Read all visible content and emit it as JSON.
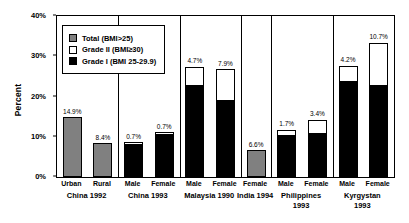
{
  "chart_data": {
    "type": "bar",
    "title": "",
    "subtitle": "",
    "xlabel": "",
    "ylabel": "Percent",
    "ylim": [
      0,
      40
    ],
    "ytick_labels": [
      "0%",
      "10%",
      "20%",
      "30%",
      "40%"
    ],
    "ytick_values": [
      0,
      10,
      20,
      30,
      40
    ],
    "grid": false,
    "stacked": true,
    "legend_position": "upper-left-inside",
    "legend": [
      {
        "key": "total",
        "label": "Total (BMI>25)",
        "color": "#808080"
      },
      {
        "key": "grade2",
        "label": "Grade II (BMI≥30)",
        "color": "#ffffff"
      },
      {
        "key": "grade1",
        "label": "Grade I (BMI 25-29.9)",
        "color": "#000000"
      }
    ],
    "groups": [
      {
        "name": "China 1992",
        "bars": [
          {
            "category": "Urban",
            "series": "total",
            "total": 14.9,
            "grade1": null,
            "grade2": null,
            "label": "14.9%"
          },
          {
            "category": "Rural",
            "series": "total",
            "total": 8.4,
            "grade1": null,
            "grade2": null,
            "label": "8.4%"
          }
        ]
      },
      {
        "name": "China 1993",
        "bars": [
          {
            "category": "Male",
            "series": "stacked",
            "total": 8.6,
            "grade1": 7.9,
            "grade2": 0.7,
            "label": "0.7%"
          },
          {
            "category": "Female",
            "series": "stacked",
            "total": 11.1,
            "grade1": 10.4,
            "grade2": 0.7,
            "label": "0.7%"
          }
        ]
      },
      {
        "name": "Malaysia 1990",
        "bars": [
          {
            "category": "Male",
            "series": "stacked",
            "total": 27.4,
            "grade1": 22.7,
            "grade2": 4.7,
            "label": "4.7%"
          },
          {
            "category": "Female",
            "series": "stacked",
            "total": 26.8,
            "grade1": 18.9,
            "grade2": 7.9,
            "label": "7.9%"
          }
        ]
      },
      {
        "name": "India 1994",
        "bars": [
          {
            "category": "Female",
            "series": "total",
            "total": 6.6,
            "grade1": null,
            "grade2": null,
            "label": "6.6%"
          }
        ]
      },
      {
        "name": "Philippines 1993",
        "bars": [
          {
            "category": "Male",
            "series": "stacked",
            "total": 11.8,
            "grade1": 10.1,
            "grade2": 1.7,
            "label": "1.7%"
          },
          {
            "category": "Female",
            "series": "stacked",
            "total": 14.2,
            "grade1": 10.8,
            "grade2": 3.4,
            "label": "3.4%"
          }
        ]
      },
      {
        "name": "Kyrgystan 1993",
        "bars": [
          {
            "category": "Male",
            "series": "stacked",
            "total": 27.7,
            "grade1": 23.5,
            "grade2": 4.2,
            "label": "4.2%"
          },
          {
            "category": "Female",
            "series": "stacked",
            "total": 33.4,
            "grade1": 22.7,
            "grade2": 10.7,
            "label": "10.7%"
          }
        ]
      }
    ],
    "group_label_lines": [
      [
        "China 1992"
      ],
      [
        "China 1993"
      ],
      [
        "Malaysia 1990"
      ],
      [
        "India 1994"
      ],
      [
        "Philippines",
        "1993"
      ],
      [
        "Kyrgystan",
        "1993"
      ]
    ]
  }
}
